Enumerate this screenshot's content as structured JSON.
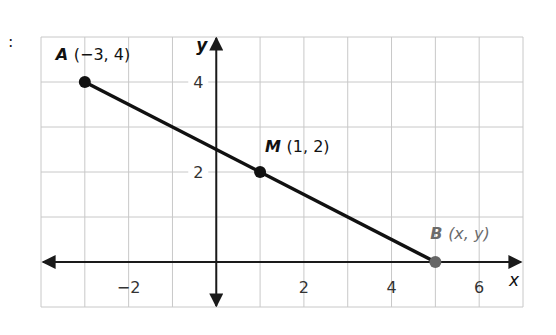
{
  "prefix_mark": ":",
  "chart_data": {
    "type": "line",
    "title": "",
    "xlabel": "x",
    "ylabel": "y",
    "xlim": [
      -4,
      7
    ],
    "ylim": [
      -1,
      5
    ],
    "grid": true,
    "x_ticks": [
      -2,
      2,
      4,
      6
    ],
    "y_ticks": [
      2,
      4
    ],
    "x_tick_labels": [
      "−2",
      "2",
      "4",
      "6"
    ],
    "y_tick_labels": [
      "2",
      "4"
    ],
    "segment": {
      "from": "A",
      "to": "B",
      "color": "#111111"
    },
    "points": [
      {
        "name": "A",
        "label_name": "A",
        "label_coords": "(−3, 4)",
        "x": -3,
        "y": 4,
        "color": "#111111",
        "label_color": "#111111"
      },
      {
        "name": "M",
        "label_name": "M",
        "label_coords": "(1, 2)",
        "x": 1,
        "y": 2,
        "color": "#111111",
        "label_color": "#111111"
      },
      {
        "name": "B",
        "label_name": "B",
        "label_coords": "(x, y)",
        "x": 5,
        "y": 0,
        "color": "#666666",
        "label_color": "#6b6b6b"
      }
    ],
    "colors": {
      "grid": "#c8c8c8",
      "axis": "#1a1a1a",
      "tick_text": "#333333"
    }
  }
}
